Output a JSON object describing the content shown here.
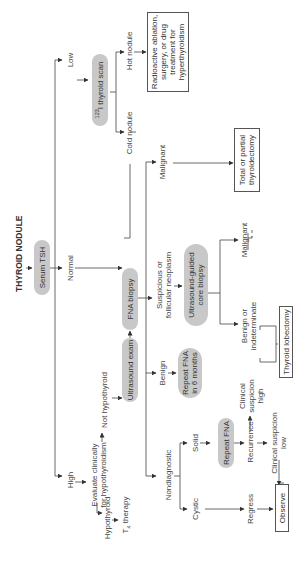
{
  "title": "THYROID NODULE",
  "nodes": {
    "serum_tsh": "Serum TSH",
    "low": "Low",
    "normal": "Normal",
    "high": "High",
    "thyroid_scan_sup": "123",
    "thyroid_scan": "I thyroid scan",
    "hot_nodule": "Hot nodule",
    "cold_nodule": "Cold nodule",
    "radioactive": "Radioactive ablation, surgery, or drug treatment for hyperthyroidism",
    "evaluate": "Evaluate clinically for hypothyroidism",
    "hypothyroid": "Hypothyroid",
    "t4_therapy_t": "T",
    "t4_therapy_sub": "4",
    "t4_therapy_rest": " therapy",
    "not_hypothyroid": "Not hypothyroid",
    "ultrasound_exam": "Ultrasound exam",
    "fna_biopsy": "FNA biopsy",
    "malignant_top": "Malignant",
    "total_thyroidectomy": "Total or partial thyroidectomy",
    "suspicious": "Suspicious or follicular neoplasm",
    "us_core_biopsy": "Ultrasound-guided core biopsy",
    "malignant_mid": "Malignant",
    "benign_indeterminate": "Benign or indeterminate",
    "thyroid_lobectomy": "Thyroid lobectomy",
    "benign": "Benign",
    "repeat_fna_6mo": "Repeat FNA in 6 months",
    "clinical_high": "Clinical suspicion high",
    "nondiagnostic": "Nondiagnostic",
    "solid": "Solid",
    "cystic": "Cystic",
    "repeat_fna": "Repeat FNA",
    "recurrence": "Recurrence",
    "clinical_low": "Clinical suspicion low",
    "regress": "Regress",
    "observe": "Observe"
  }
}
